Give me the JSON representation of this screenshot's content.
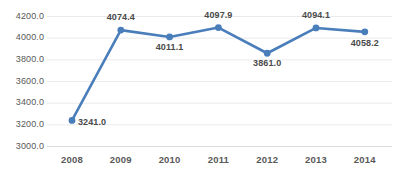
{
  "chart_data": {
    "type": "line",
    "title": "",
    "subtitle": "",
    "xlabel": "",
    "ylabel": "",
    "categories": [
      "2008",
      "2009",
      "2010",
      "2011",
      "2012",
      "2013",
      "2014"
    ],
    "values": [
      3241.0,
      4074.4,
      4011.1,
      4097.9,
      3861.0,
      4094.1,
      4058.2
    ],
    "point_labels": [
      "3241.0",
      "4074.4",
      "4011.1",
      "4097.9",
      "3861.0",
      "4094.1",
      "4058.2"
    ],
    "series": [
      {
        "name": "",
        "values": [
          3241.0,
          4074.4,
          4011.1,
          4097.9,
          3861.0,
          4094.1,
          4058.2
        ]
      }
    ],
    "ylim": [
      3000.0,
      4200.0
    ],
    "ytick_values": [
      4200.0,
      4000.0,
      3800.0,
      3600.0,
      3400.0,
      3200.0,
      3000.0
    ],
    "ytick_labels": [
      "4200.0",
      "4000.0",
      "3800.0",
      "3600.0",
      "3400.0",
      "3200.0",
      "3000.0"
    ],
    "ytick_step": 200.0,
    "grid": true,
    "grid_axis": "y",
    "legend": false,
    "legend_position": "none",
    "annotations": [],
    "colors": {
      "line": "#4a7ebb",
      "marker": "#4a7ebb",
      "gridline": "#eaeaea",
      "axis_line": "#dcdcdc",
      "tick_text": "#595959",
      "label_text": "#4a4a4a",
      "background": "#ffffff"
    },
    "style": {
      "line_width": 2.6,
      "marker_shape": "circle",
      "marker_radius": 3.4,
      "data_labels_shown": true
    },
    "label_offsets": [
      {
        "dx": 6,
        "dy": 2,
        "align": "left"
      },
      {
        "dx": 0,
        "dy": -13,
        "align": "center"
      },
      {
        "dx": 0,
        "dy": 10,
        "align": "center"
      },
      {
        "dx": 0,
        "dy": -13,
        "align": "center"
      },
      {
        "dx": 0,
        "dy": 10,
        "align": "center"
      },
      {
        "dx": 0,
        "dy": -13,
        "align": "center"
      },
      {
        "dx": 0,
        "dy": 11,
        "align": "center"
      }
    ]
  }
}
